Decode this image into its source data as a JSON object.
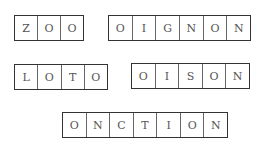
{
  "words": [
    {
      "id": "zoo",
      "letters": [
        "Z",
        "O",
        "O"
      ]
    },
    {
      "id": "oignon",
      "letters": [
        "O",
        "I",
        "G",
        "N",
        "O",
        "N"
      ]
    },
    {
      "id": "loto",
      "letters": [
        "L",
        "O",
        "T",
        "O"
      ]
    },
    {
      "id": "oison",
      "letters": [
        "O",
        "I",
        "S",
        "O",
        "N"
      ]
    },
    {
      "id": "onction",
      "letters": [
        "O",
        "N",
        "C",
        "T",
        "I",
        "O",
        "N"
      ]
    }
  ]
}
